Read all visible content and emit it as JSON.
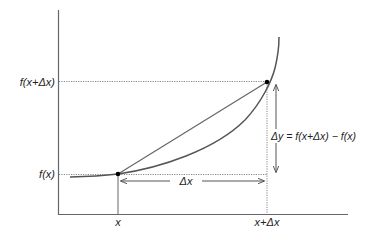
{
  "diagram": {
    "labels": {
      "y_upper": "f(x+Δx)",
      "y_lower": "f(x)",
      "x_left": "x",
      "x_right": "x+Δx",
      "delta_x": "Δx",
      "delta_y": "Δy = f(x+Δx) − f(x)"
    },
    "points": [
      {
        "name": "A",
        "label": "(x, f(x))"
      },
      {
        "name": "B",
        "label": "(x+Δx, f(x+Δx))"
      }
    ],
    "colors": {
      "axis": "#666666",
      "curve": "#555555",
      "secant": "#666666",
      "dotted_guides": "#888888",
      "points": "#000000",
      "text": "#222222"
    }
  }
}
